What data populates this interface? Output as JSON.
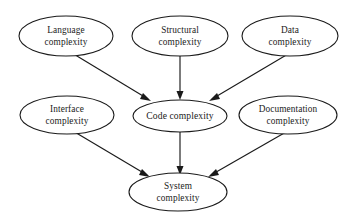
{
  "diagram": {
    "type": "directed-graph",
    "background_color": "#ffffff",
    "stroke_color": "#1a1a1a",
    "nodes": [
      {
        "id": "language",
        "label_line1": "Language",
        "label_line2": "complexity",
        "cx": 66,
        "cy": 36,
        "rx": 47,
        "ry": 20
      },
      {
        "id": "structural",
        "label_line1": "Structural",
        "label_line2": "complexity",
        "cx": 180,
        "cy": 36,
        "rx": 48,
        "ry": 20
      },
      {
        "id": "data",
        "label_line1": "Data",
        "label_line2": "complexity",
        "cx": 290,
        "cy": 36,
        "rx": 48,
        "ry": 20
      },
      {
        "id": "interface",
        "label_line1": "Interface",
        "label_line2": "complexity",
        "cx": 67,
        "cy": 115,
        "rx": 47,
        "ry": 19
      },
      {
        "id": "code",
        "label_line1": "Code complexity",
        "label_line2": "",
        "cx": 180,
        "cy": 116,
        "rx": 47,
        "ry": 16
      },
      {
        "id": "documentation",
        "label_line1": "Documentation",
        "label_line2": "complexity",
        "cx": 288,
        "cy": 115,
        "rx": 49,
        "ry": 19
      },
      {
        "id": "system",
        "label_line1": "System",
        "label_line2": "complexity",
        "cx": 178,
        "cy": 192,
        "rx": 49,
        "ry": 19
      }
    ],
    "edges": [
      {
        "id": "language-to-code",
        "from": "language",
        "to": "code",
        "x1": 72,
        "y1": 53,
        "x2": 151,
        "y2": 101
      },
      {
        "id": "structural-to-code",
        "from": "structural",
        "to": "code",
        "x1": 180,
        "y1": 56,
        "x2": 180,
        "y2": 99
      },
      {
        "id": "data-to-code",
        "from": "data",
        "to": "code",
        "x1": 288,
        "y1": 54,
        "x2": 209,
        "y2": 101
      },
      {
        "id": "interface-to-system",
        "from": "interface",
        "to": "system",
        "x1": 73,
        "y1": 131,
        "x2": 150,
        "y2": 177
      },
      {
        "id": "code-to-system",
        "from": "code",
        "to": "system",
        "x1": 180,
        "y1": 132,
        "x2": 180,
        "y2": 174
      },
      {
        "id": "documentation-to-system",
        "from": "documentation",
        "to": "system",
        "x1": 286,
        "y1": 132,
        "x2": 208,
        "y2": 177
      }
    ]
  }
}
